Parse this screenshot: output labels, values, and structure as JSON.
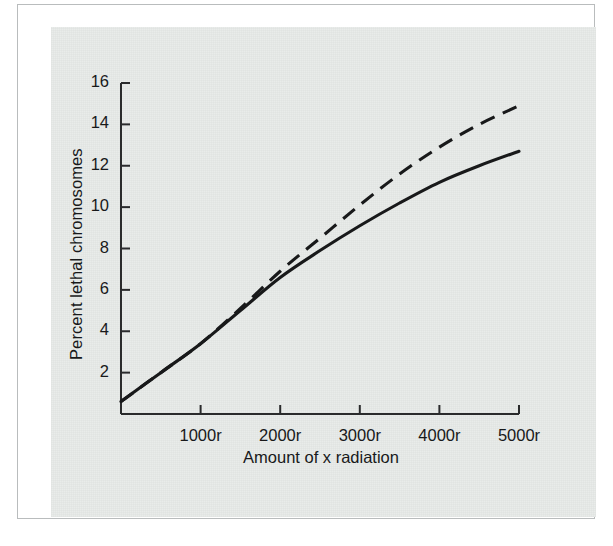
{
  "figure": {
    "panel_bg": "#e9ecea",
    "ink": "#18191a",
    "frame_color": "#b9bcbd"
  },
  "chart_data": {
    "type": "line",
    "title": "",
    "xlabel": "Amount of x radiation",
    "ylabel": "Percent lethal chromosomes",
    "xlim": [
      0,
      5000
    ],
    "ylim": [
      0,
      16
    ],
    "grid": false,
    "legend": "none",
    "x_tick_labels": [
      "1000r",
      "2000r",
      "3000r",
      "4000r",
      "5000r"
    ],
    "x_tick_values": [
      1000,
      2000,
      3000,
      4000,
      5000
    ],
    "y_tick_labels": [
      "2",
      "4",
      "6",
      "8",
      "10",
      "12",
      "14",
      "16"
    ],
    "y_tick_values": [
      2,
      4,
      6,
      8,
      10,
      12,
      14,
      16
    ],
    "x": [
      0,
      500,
      1000,
      1500,
      2000,
      2500,
      3000,
      3500,
      4000,
      4500,
      5000
    ],
    "series": [
      {
        "name": "solid curve",
        "style": "solid",
        "color": "#18191a",
        "values": [
          0.6,
          2.0,
          3.4,
          5.0,
          6.6,
          7.9,
          9.1,
          10.2,
          11.2,
          12.0,
          12.7
        ]
      },
      {
        "name": "dashed curve",
        "style": "dashed",
        "color": "#18191a",
        "values": [
          0.6,
          2.0,
          3.4,
          5.1,
          6.9,
          8.5,
          10.1,
          11.6,
          12.9,
          14.0,
          14.9
        ]
      }
    ],
    "annotations": []
  }
}
